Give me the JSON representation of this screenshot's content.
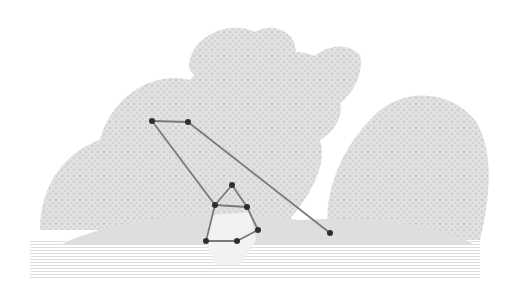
{
  "image": {
    "description": "Engraving of a wooded river landscape with a figure standing in water, overlaid with a keypoint skeleton",
    "width": 515,
    "height": 304,
    "background": "#ffffff",
    "engraving_color": "#d4d4d4",
    "engraving_dark": "#c4c4c4"
  },
  "overlay": {
    "line_color": "#7a7a7a",
    "point_color": "#2e2e2e",
    "point_radius": 3,
    "line_width": 1.8,
    "points": [
      {
        "id": "p1",
        "x": 152,
        "y": 121
      },
      {
        "id": "p2",
        "x": 188,
        "y": 122
      },
      {
        "id": "p3",
        "x": 232,
        "y": 185
      },
      {
        "id": "p4",
        "x": 215,
        "y": 205
      },
      {
        "id": "p5",
        "x": 247,
        "y": 207
      },
      {
        "id": "p6",
        "x": 258,
        "y": 230
      },
      {
        "id": "p7",
        "x": 206,
        "y": 241
      },
      {
        "id": "p8",
        "x": 237,
        "y": 241
      },
      {
        "id": "p9",
        "x": 330,
        "y": 233
      }
    ],
    "edges": [
      [
        "p1",
        "p2"
      ],
      [
        "p2",
        "p9"
      ],
      [
        "p1",
        "p4"
      ],
      [
        "p4",
        "p3"
      ],
      [
        "p3",
        "p5"
      ],
      [
        "p4",
        "p5"
      ],
      [
        "p4",
        "p7"
      ],
      [
        "p5",
        "p6"
      ],
      [
        "p6",
        "p8"
      ],
      [
        "p7",
        "p8"
      ]
    ]
  }
}
